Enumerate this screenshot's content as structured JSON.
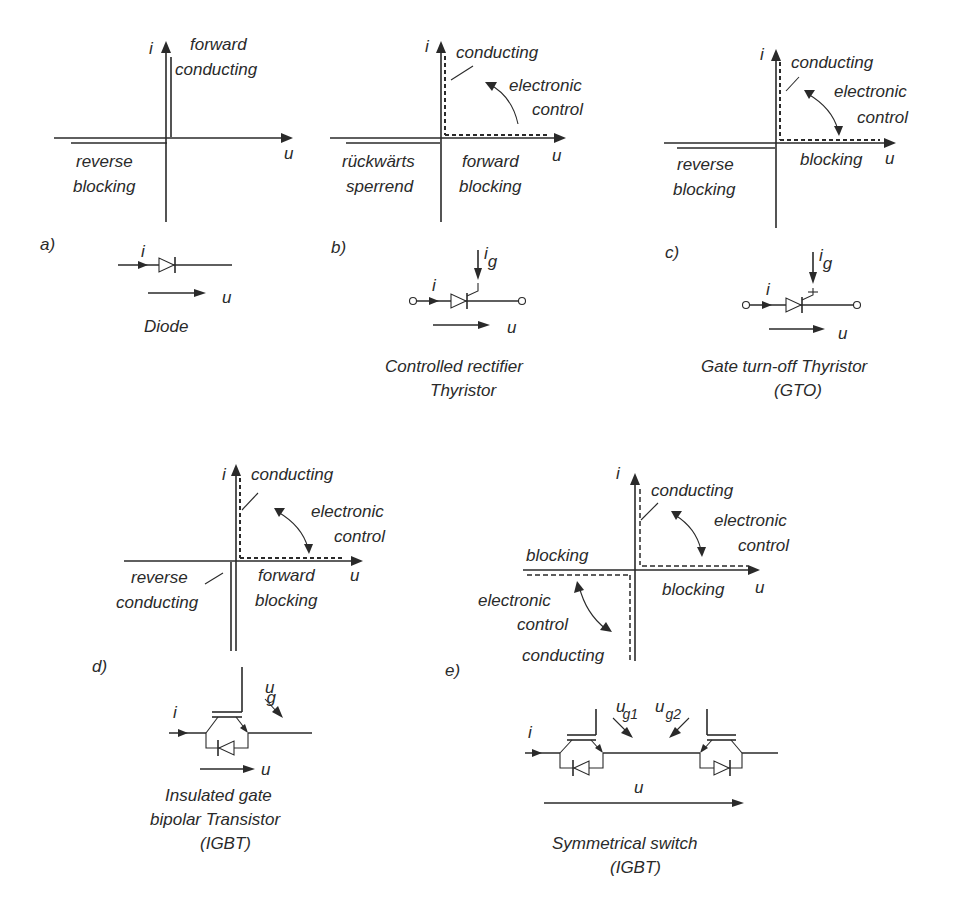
{
  "panels": {
    "a": {
      "tag": "a)",
      "axis_i": "i",
      "axis_u": "u",
      "q1_line1": "forward",
      "q1_line2": "conducting",
      "q3_line1": "reverse",
      "q3_line2": "blocking",
      "sym_i": "i",
      "sym_u": "u",
      "caption1": "Diode"
    },
    "b": {
      "tag": "b)",
      "axis_i": "i",
      "axis_u": "u",
      "q1_label": "conducting",
      "ctrl1": "electronic",
      "ctrl2": "control",
      "q3_line1": "rückwärts",
      "q3_line2": "sperrend",
      "q4_line1": "forward",
      "q4_line2": "blocking",
      "sym_i": "i",
      "sym_ig": "i",
      "sym_ig_sub": "g",
      "sym_u": "u",
      "caption1": "Controlled rectifier",
      "caption2": "Thyristor"
    },
    "c": {
      "tag": "c)",
      "axis_i": "i",
      "axis_u": "u",
      "q1_label": "conducting",
      "ctrl1": "electronic",
      "ctrl2": "control",
      "q3_line1": "reverse",
      "q3_line2": "blocking",
      "q4_label": "blocking",
      "sym_i": "i",
      "sym_ig": "i",
      "sym_ig_sub": "g",
      "sym_u": "u",
      "caption1": "Gate turn-off Thyristor",
      "caption2": "(GTO)"
    },
    "d": {
      "tag": "d)",
      "axis_i": "i",
      "axis_u": "u",
      "q1_label": "conducting",
      "ctrl1": "electronic",
      "ctrl2": "control",
      "q3_line1": "reverse",
      "q3_line2": "conducting",
      "q4_line1": "forward",
      "q4_line2": "blocking",
      "sym_i": "i",
      "sym_ug": "u",
      "sym_ug_sub": "g",
      "sym_u": "u",
      "caption1": "Insulated gate",
      "caption2": "bipolar Transistor",
      "caption3": "(IGBT)"
    },
    "e": {
      "tag": "e)",
      "axis_i": "i",
      "axis_u": "u",
      "q1_label": "conducting",
      "ctrl1": "electronic",
      "ctrl2": "control",
      "q2_label": "blocking",
      "q4_label": "blocking",
      "q3_ctrl1": "electronic",
      "q3_ctrl2": "control",
      "q3_label": "conducting",
      "sym_i": "i",
      "sym_ug1": "u",
      "sym_ug1_sub": "g1",
      "sym_ug2": "u",
      "sym_ug2_sub": "g2",
      "sym_u": "u",
      "caption1": "Symmetrical switch",
      "caption2": "(IGBT)"
    }
  }
}
